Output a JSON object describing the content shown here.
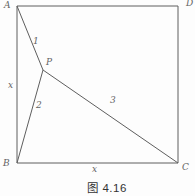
{
  "figure": {
    "caption": "图 4.16",
    "colors": {
      "background": "#fdfdfd",
      "line": "#5e5e5e",
      "label": "#636363",
      "caption": "#333333"
    },
    "points": {
      "A": {
        "x": 17,
        "y": 6
      },
      "D": {
        "x": 178,
        "y": 6
      },
      "C": {
        "x": 178,
        "y": 163
      },
      "B": {
        "x": 17,
        "y": 163
      },
      "P": {
        "x": 43,
        "y": 70
      }
    },
    "square_corner_order": [
      "A",
      "D",
      "C",
      "B"
    ],
    "segments": [
      {
        "from": "A",
        "to": "P",
        "label": "1",
        "label_x": 33,
        "label_y": 44
      },
      {
        "from": "P",
        "to": "B",
        "label": "2",
        "label_x": 36,
        "label_y": 108
      },
      {
        "from": "P",
        "to": "C",
        "label": "3",
        "label_x": 110,
        "label_y": 103
      }
    ],
    "vertex_labels": [
      {
        "text": "A",
        "x": 4,
        "y": 8
      },
      {
        "text": "D",
        "x": 186,
        "y": 6
      },
      {
        "text": "B",
        "x": 3,
        "y": 166
      },
      {
        "text": "C",
        "x": 182,
        "y": 170
      },
      {
        "text": "P",
        "x": 46,
        "y": 65
      }
    ],
    "side_labels": [
      {
        "text": "x",
        "x": 8,
        "y": 88
      },
      {
        "text": "x",
        "x": 92,
        "y": 172
      }
    ]
  }
}
